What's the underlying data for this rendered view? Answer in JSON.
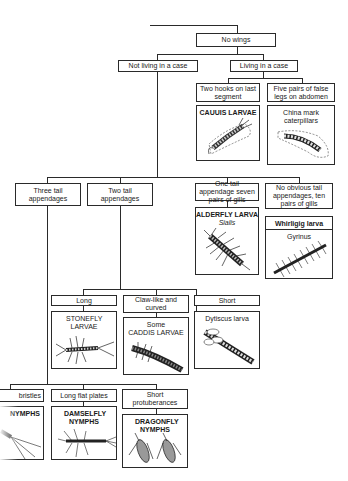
{
  "diagram": {
    "type": "dichotomous-key",
    "nodes": {
      "root": "No wings",
      "not_in_case": "Not living in a case",
      "in_case": "Living in a case",
      "two_hooks": "Two hooks on last segment",
      "five_pairs": "Five pairs of false legs on abdomen",
      "three_tail": "Three tail appendages",
      "two_tail": "Two tail appendages",
      "one_tail": "One tail appendage seven pairs of gills",
      "no_tail": "No obvious tail appendages, ten pairs of gills",
      "long": "Long",
      "claw": "Claw-like and curved",
      "short": "Short",
      "bristles": "bristles",
      "flat_plates": "Long flat plates",
      "short_protuberances": "Short protuberances"
    },
    "results": {
      "caddis_case": {
        "title": "CAUUIS LARVAE"
      },
      "china_mark": {
        "title": "China mark caterpillars"
      },
      "alderfly": {
        "title": "ALDERFLY LARVA",
        "sub": "Sialis"
      },
      "whirligig": {
        "title": "Whirligig larva",
        "sub": "Gyrinus"
      },
      "stonefly": {
        "title": "STONEFLY LARVAE"
      },
      "some_caddis_pre": "Some",
      "some_caddis": {
        "title": "CADDIS LARVAE"
      },
      "dytiscus": {
        "title": "Dytiscus larva"
      },
      "mayfly": {
        "title": "NYMPHS"
      },
      "damselfly": {
        "title": "DAMSELFLY NYMPHS"
      },
      "dragonfly": {
        "title": "DRAGONFLY NYMPHS"
      }
    }
  }
}
